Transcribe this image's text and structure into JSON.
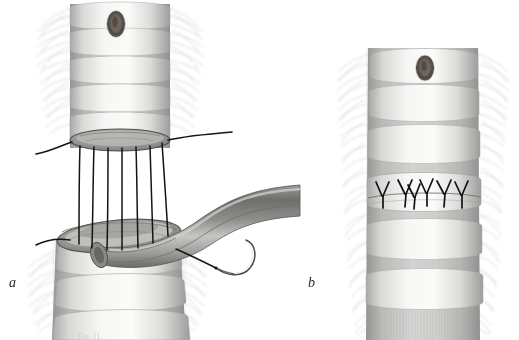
{
  "figure": {
    "background_color": "#ffffff",
    "width": 519,
    "height": 340,
    "medium": "pencil / graphite anatomical drawing",
    "caption_fragment": "Fig. 11.",
    "panels": [
      {
        "id": "a",
        "letter": "a",
        "description": "Upper and lower tracheal stumps separated, interrupted sutures placed but untied, bronchus-like tube passing through the gap, curved needle with trailing suture at lower right"
      },
      {
        "id": "b",
        "letter": "b",
        "description": "Completed anastomosis with the suture line tied, knots shown as Y shapes along the circumference"
      }
    ]
  },
  "panel_a": {
    "letter": "a",
    "upper_trachea": {
      "name": "upper tracheal stump",
      "cartilage_ring_count": 5,
      "stoma": {
        "name": "oval stoma opening",
        "label": "tracheal stoma",
        "cx": 116,
        "cy": 24,
        "rx": 8,
        "ry": 12
      }
    },
    "lower_trachea": {
      "name": "lower tracheal stump",
      "cartilage_ring_count": 4
    },
    "tube": {
      "name": "curved tube (bronchus)",
      "shading": "dark graphite, curving from lower-left to right edge"
    },
    "sutures": {
      "name": "interrupted untied sutures",
      "vertical_thread_count": 7,
      "thread_color": "#141414",
      "free_tails": [
        {
          "name": "upper-left suture tail",
          "side": "left"
        },
        {
          "name": "upper-right long suture tail",
          "side": "right"
        },
        {
          "name": "lower-left suture tail",
          "side": "left"
        },
        {
          "name": "needle suture tail",
          "side": "right"
        }
      ],
      "needle": {
        "name": "curved surgical needle",
        "present": true
      }
    }
  },
  "panel_b": {
    "letter": "b",
    "trachea": {
      "name": "anastomosed trachea",
      "cartilage_ring_count": 6,
      "stoma": {
        "name": "oval stoma opening",
        "label": "tracheal stoma",
        "cx": 425,
        "cy": 68,
        "rx": 8,
        "ry": 11
      }
    },
    "suture_line": {
      "name": "completed suture line",
      "knot_count": 6,
      "knot_shape": "Y-shaped tied knot with two tails",
      "thread_color": "#121212"
    }
  },
  "colors": {
    "background": "#ffffff",
    "ink_dark": "#141414",
    "graphite_mid": "#8a8a8a",
    "graphite_light": "#c9c9c9",
    "cartilage_highlight": "#f3f3f2",
    "cartilage_shadow": "#a9a9a7",
    "tissue_fringe": "#b8b8b6",
    "label_text": "#2a2a2a",
    "caption_text": "#cfcfcf"
  }
}
